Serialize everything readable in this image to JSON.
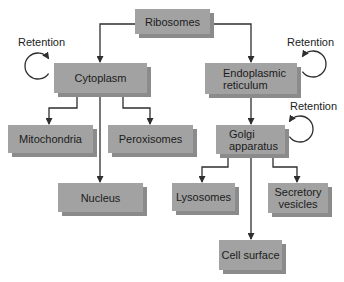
{
  "colors": {
    "box_fill": "#a2a2a2",
    "box_shadow": "#8b8b8b",
    "line": "#2e2e2e",
    "text": "#1c1c1c",
    "background": "#ffffff"
  },
  "nodes": {
    "ribosomes": "Ribosomes",
    "cytoplasm": "Cytoplasm",
    "er": "Endoplasmic\nreticulum",
    "golgi": "Golgi\napparatus",
    "mitochondria": "Mitochondria",
    "peroxisomes": "Peroxisomes",
    "nucleus": "Nucleus",
    "lysosomes": "Lysosomes",
    "secretory": "Secretory\nvesicles",
    "cell_surface": "Cell surface"
  },
  "retention_labels": {
    "cytoplasm": "Retention",
    "er": "Retention",
    "golgi": "Retention"
  },
  "edges": [
    {
      "from": "Ribosomes",
      "to": "Cytoplasm"
    },
    {
      "from": "Ribosomes",
      "to": "Endoplasmic reticulum"
    },
    {
      "from": "Cytoplasm",
      "to": "Mitochondria"
    },
    {
      "from": "Cytoplasm",
      "to": "Peroxisomes"
    },
    {
      "from": "Cytoplasm",
      "to": "Nucleus"
    },
    {
      "from": "Endoplasmic reticulum",
      "to": "Golgi apparatus"
    },
    {
      "from": "Golgi apparatus",
      "to": "Lysosomes"
    },
    {
      "from": "Golgi apparatus",
      "to": "Secretory vesicles"
    },
    {
      "from": "Golgi apparatus",
      "to": "Cell surface"
    },
    {
      "from": "Cytoplasm",
      "to": "Cytoplasm",
      "label": "Retention"
    },
    {
      "from": "Endoplasmic reticulum",
      "to": "Endoplasmic reticulum",
      "label": "Retention"
    },
    {
      "from": "Golgi apparatus",
      "to": "Golgi apparatus",
      "label": "Retention"
    }
  ]
}
